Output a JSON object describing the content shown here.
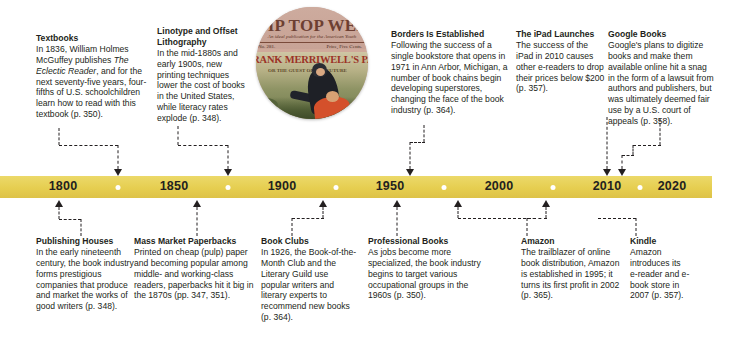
{
  "figure": {
    "type": "timeline-infographic"
  },
  "timeline": {
    "axis_color": "#e6ce50",
    "years": [
      "1800",
      "1850",
      "1900",
      "1950",
      "2000",
      "2010",
      "2020"
    ],
    "year_x": [
      63,
      174,
      282,
      390,
      499,
      607,
      672
    ],
    "minor_tick_x": [
      118,
      228,
      336,
      444,
      553,
      640
    ],
    "bar": {
      "left": 0,
      "top": 176,
      "width": 712,
      "height": 22
    }
  },
  "image": {
    "name": "tip-top-weekly-cover",
    "alt": "Circular crop of a vintage Tip Top Weekly dime-novel magazine cover",
    "masthead": "TIP TOP WEEKLY",
    "masthead_subtitle": "An ideal publication for the American Youth",
    "issue": "No. 281.",
    "price": "Price, Five Cents.",
    "story_title": "FRANK MERRIWELL'S PARTY",
    "story_subtitle": "OR THE GUEST\nOF THE FUTURE"
  },
  "entries_above": [
    {
      "id": "textbooks",
      "heading": "Textbooks",
      "body_html": "In 1836, William Holmes McGuffey publishes <i>The Eclectic Reader</i>, and for the next seventy-five years, four-fifths of U.S. schoolchildren learn how to read with this textbook (p.&nbsp;350).",
      "body_text": "In 1836, William Holmes McGuffey publishes The Eclectic Reader, and for the next seventy-five years, four-fifths of U.S. schoolchildren learn how to read with this textbook (p. 350).",
      "page_ref": "p. 350",
      "year_anchor": "1836"
    },
    {
      "id": "linotype-offset-lithography",
      "heading": "Linotype and Offset Lithography",
      "body_html": "In the mid-1880s and early 1900s, new printing techniques lower the cost of books in the United States, while literacy rates explode (p.&nbsp;348).",
      "body_text": "In the mid-1880s and early 1900s, new printing techniques lower the cost of books in the United States, while literacy rates explode (p. 348).",
      "page_ref": "p. 348",
      "year_anchor": "1885"
    },
    {
      "id": "borders-is-established",
      "heading": "Borders Is Established",
      "body_html": "Following the success of a single bookstore that opens in 1971 in Ann Arbor, Michigan, a number of book chains begin developing superstores, changing the face of the book industry (p.&nbsp;364).",
      "body_text": "Following the success of a single bookstore that opens in 1971 in Ann Arbor, Michigan, a number of book chains begin developing superstores, changing the face of the book industry (p. 364).",
      "page_ref": "p. 364",
      "year_anchor": "1971"
    },
    {
      "id": "the-ipad-launches",
      "heading": "The iPad Launches",
      "body_html": "The success of the iPad in 2010 causes other e-readers to drop their prices below $200 (p.&nbsp;357).",
      "body_text": "The success of the iPad in 2010 causes other e-readers to drop their prices below $200 (p. 357).",
      "page_ref": "p. 357",
      "year_anchor": "2010"
    },
    {
      "id": "google-books",
      "heading": "Google Books",
      "body_html": "Google's plans to digitize books and make them available online hit a snag in the form of a lawsuit from authors and publishers, but was ultimately deemed fair use by a U.S. court of appeals (p.&nbsp;358).",
      "body_text": "Google's plans to digitize books and make them available online hit a snag in the form of a lawsuit from authors and publishers, but was ultimately deemed fair use by a U.S. court of appeals (p. 358).",
      "page_ref": "p. 358",
      "year_anchor": "2013"
    }
  ],
  "entries_below": [
    {
      "id": "publishing-houses",
      "heading": "Publishing Houses",
      "body_html": "In the early nineteenth century, the book industry forms prestigious companies that produce and market the works of good writers (p.&nbsp;348).",
      "body_text": "In the early nineteenth century, the book industry forms prestigious companies that produce and market the works of good writers (p. 348).",
      "page_ref": "p. 348",
      "year_anchor": "1810"
    },
    {
      "id": "mass-market-paperbacks",
      "heading": "Mass Market Paperbacks",
      "body_html": "Printed on cheap (pulp) paper and becoming popular among middle- and working-class readers, paperbacks hit it big in the 1870s (pp.&nbsp;347, 351).",
      "body_text": "Printed on cheap (pulp) paper and becoming popular among middle- and working-class readers, paperbacks hit it big in the 1870s (pp. 347, 351).",
      "page_ref": "pp. 347, 351",
      "year_anchor": "1870"
    },
    {
      "id": "book-clubs",
      "heading": "Book Clubs",
      "body_html": "In 1926, the Book-of-the-Month Club and the Literary Guild use popular writers and literary experts to recommend new books (p.&nbsp;364).",
      "body_text": "In 1926, the Book-of-the-Month Club and the Literary Guild use popular writers and literary experts to recommend new books (p. 364).",
      "page_ref": "p. 364",
      "year_anchor": "1926"
    },
    {
      "id": "professional-books",
      "heading": "Professional Books",
      "body_html": "As jobs become more specialized, the book industry begins to target various occupational groups in the 1960s (p.&nbsp;350).",
      "body_text": "As jobs become more specialized, the book industry begins to target various occupational groups in the 1960s (p. 350).",
      "page_ref": "p. 350",
      "year_anchor": "1960"
    },
    {
      "id": "amazon",
      "heading": "Amazon",
      "body_html": "The trailblazer of online book distribution, Amazon is established in 1995; it turns its first profit in 2002 (p.&nbsp;365).",
      "body_text": "The trailblazer of online book distribution, Amazon is established in 1995; it turns its first profit in 2002 (p. 365).",
      "page_ref": "p. 365",
      "year_anchor": "1995"
    },
    {
      "id": "kindle",
      "heading": "Kindle",
      "body_html": "Amazon introduces its e-reader and e-book store in 2007 (p.&nbsp;357).",
      "body_text": "Amazon introduces its e-reader and e-book store in 2007 (p. 357).",
      "page_ref": "p. 357",
      "year_anchor": "2007"
    }
  ]
}
